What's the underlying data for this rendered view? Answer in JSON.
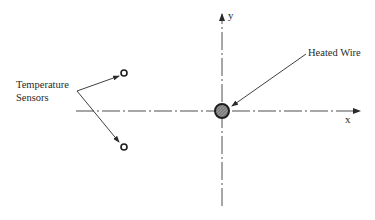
{
  "diagram": {
    "type": "schematic",
    "labels": {
      "sensors_line1": "Temperature",
      "sensors_line2": "Sensors",
      "heated_wire": "Heated Wire",
      "x_axis": "x",
      "y_axis": "y"
    },
    "elements": {
      "heated_wire": {
        "shape": "hatched-circle",
        "cx": 222,
        "cy": 111,
        "r": 7
      },
      "sensors": [
        {
          "shape": "open-circle",
          "cx": 124,
          "cy": 73,
          "r": 3
        },
        {
          "shape": "open-circle",
          "cx": 124,
          "cy": 147,
          "r": 3
        }
      ],
      "x_axis": {
        "style": "dash-dot",
        "from": [
          76,
          111
        ],
        "to": [
          360,
          111
        ],
        "arrow": "end"
      },
      "y_axis": {
        "style": "dash-dot",
        "from": [
          222,
          206
        ],
        "to": [
          222,
          14
        ],
        "arrow": "end"
      }
    },
    "colors": {
      "ink": "#2a2a2a",
      "background": "#ffffff"
    }
  }
}
